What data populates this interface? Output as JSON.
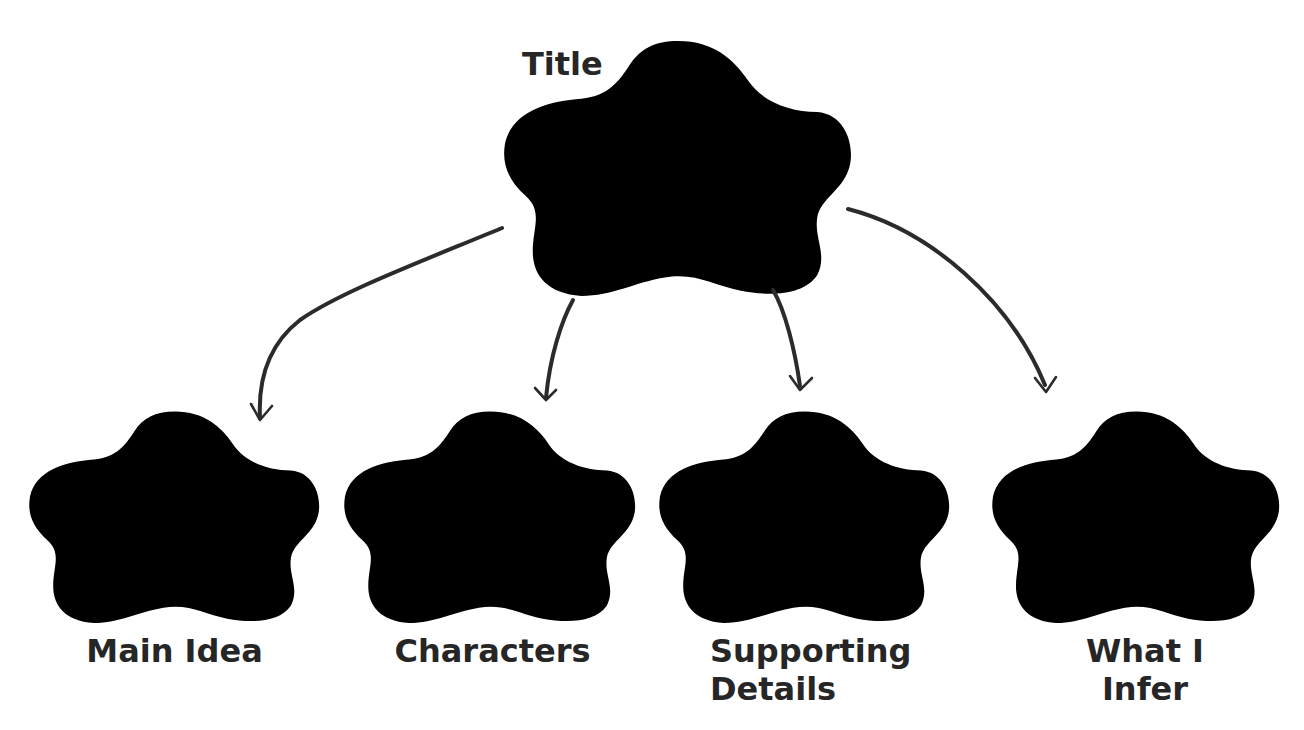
{
  "diagram": {
    "type": "graphic-organizer",
    "background": "#ffffff",
    "colors": {
      "shape_outline": "#9a9a9a",
      "arrow": "#2b2b2b",
      "text": "#262626"
    },
    "root": {
      "label": "Title",
      "shape": "flower"
    },
    "children": [
      {
        "label_line1": "Main Idea",
        "label_line2": "",
        "shape": "flower"
      },
      {
        "label_line1": "Characters",
        "label_line2": "",
        "shape": "flower"
      },
      {
        "label_line1": "Supporting",
        "label_line2": "Details",
        "shape": "flower"
      },
      {
        "label_line1": "What I",
        "label_line2": "Infer",
        "shape": "flower"
      }
    ],
    "edges": [
      {
        "from": "Title",
        "to": "Main Idea"
      },
      {
        "from": "Title",
        "to": "Characters"
      },
      {
        "from": "Title",
        "to": "Supporting Details"
      },
      {
        "from": "Title",
        "to": "What I Infer"
      }
    ]
  }
}
